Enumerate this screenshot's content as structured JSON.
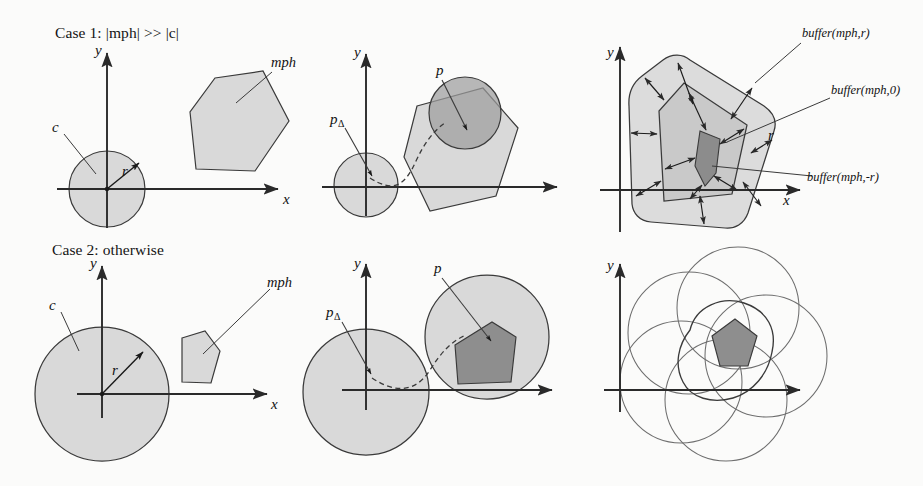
{
  "figure": {
    "background_color": "#fbfbfa",
    "ink_color": "#2a2a2a",
    "fill_light": "#d9d9d9",
    "fill_mid": "#9c9c9c",
    "fill_dark": "#8c8c8c",
    "case_labels": {
      "case1_prefix": "Case 1: ",
      "case1_expr_open": "|",
      "case1_mph": "mph",
      "case1_mid": "| >> |",
      "case1_c": "c",
      "case1_close": "|",
      "case1_full": "Case 1: |mph| >> |c|",
      "case2_full": "Case 2: otherwise"
    },
    "panels": [
      {
        "id": "panel-top-left",
        "row": "case1",
        "column": "left",
        "axis_x_label": "x",
        "axis_y_label": "y",
        "labels": [
          {
            "name": "circle-c-label",
            "text": "c"
          },
          {
            "name": "radius-r-label",
            "text": "r"
          },
          {
            "name": "polygon-mph-label",
            "text": "mph"
          }
        ]
      },
      {
        "id": "panel-top-middle",
        "row": "case1",
        "column": "middle",
        "axis_x_label": "x",
        "axis_y_label": "y",
        "labels": [
          {
            "name": "point-p-delta-label",
            "text": "p",
            "sub": "Δ"
          },
          {
            "name": "point-p-label",
            "text": "p"
          }
        ]
      },
      {
        "id": "panel-top-right",
        "row": "case1",
        "column": "right",
        "axis_x_label": "x",
        "axis_y_label": "y",
        "labels": [
          {
            "name": "buffer-positive-label",
            "text": "buffer(mph,r)"
          },
          {
            "name": "buffer-zero-label",
            "text": "buffer(mph,0)"
          },
          {
            "name": "buffer-negative-label",
            "text": "buffer(mph,-r)"
          },
          {
            "name": "radius-r-label",
            "text": "r"
          }
        ]
      },
      {
        "id": "panel-bottom-left",
        "row": "case2",
        "column": "left",
        "axis_x_label": "x",
        "axis_y_label": "y",
        "labels": [
          {
            "name": "circle-c-label",
            "text": "c"
          },
          {
            "name": "radius-r-label",
            "text": "r"
          },
          {
            "name": "polygon-mph-label",
            "text": "mph"
          }
        ]
      },
      {
        "id": "panel-bottom-middle",
        "row": "case2",
        "column": "middle",
        "axis_x_label": "x",
        "axis_y_label": "y",
        "labels": [
          {
            "name": "point-p-delta-label",
            "text": "p",
            "sub": "Δ"
          },
          {
            "name": "point-p-label",
            "text": "p"
          }
        ]
      },
      {
        "id": "panel-bottom-right",
        "row": "case2",
        "column": "right",
        "axis_x_label": "x",
        "axis_y_label": "y",
        "labels": []
      }
    ]
  },
  "text": {
    "case1": "Case 1: |mph| >> |c|",
    "case2": "Case 2: otherwise",
    "axis_x": "x",
    "axis_y": "y",
    "c": "c",
    "r": "r",
    "p": "p",
    "mph": "mph",
    "delta": "Δ",
    "buffer_pos": "buffer(mph,r)",
    "buffer_zero": "buffer(mph,0)",
    "buffer_neg": "buffer(mph,-r)"
  }
}
